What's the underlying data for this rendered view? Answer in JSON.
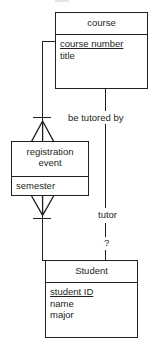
{
  "diagram": {
    "kind": "entity-relationship-diagram",
    "notation": "crows-foot",
    "width": 156,
    "height": 348,
    "background": "#ffffff",
    "line_color": "#231f20",
    "text_color": "#231f20"
  },
  "entities": [
    {
      "id": "course",
      "name": "course",
      "attributes": [
        {
          "label": "course number",
          "key": true
        },
        {
          "label": "title",
          "key": false
        }
      ]
    },
    {
      "id": "registration_event",
      "name": "registration\nevent",
      "attributes": [
        {
          "label": "semester",
          "key": false
        }
      ]
    },
    {
      "id": "student",
      "name": "Student",
      "attributes": [
        {
          "label": "student ID",
          "key": true
        },
        {
          "label": "name",
          "key": false
        },
        {
          "label": "major",
          "key": false
        }
      ]
    }
  ],
  "relationships": [
    {
      "id": "course-registration",
      "label": "",
      "from": "course",
      "to": "registration_event",
      "from_cardinality": "one",
      "to_cardinality": "many"
    },
    {
      "id": "registration-student",
      "label": "",
      "from": "registration_event",
      "to": "student",
      "from_cardinality": "many",
      "to_cardinality": "one"
    },
    {
      "id": "be-tutored-by",
      "label": "be tutored by",
      "from": "course",
      "to": "student",
      "role_label": "tutor",
      "cardinality_label": "?"
    }
  ],
  "labels": {
    "be_tutored_by": "be tutored by",
    "tutor": "tutor",
    "unknown_cardinality": "?"
  }
}
